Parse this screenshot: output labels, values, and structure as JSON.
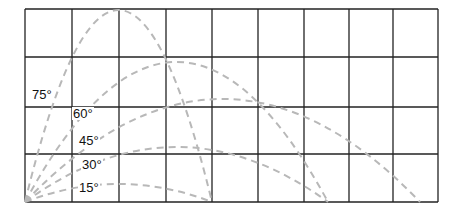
{
  "diagram": {
    "grid": {
      "left": 25,
      "top": 9,
      "right": 438,
      "bottom": 202,
      "columns_x": [
        25,
        72,
        119,
        166,
        212,
        258,
        304,
        349,
        393,
        438
      ],
      "rows_y": [
        9,
        57,
        107,
        154,
        202
      ],
      "line_color": "#222222"
    },
    "origin": {
      "x": 25,
      "y": 202
    },
    "curve_color": "#b8b8b8",
    "trajectories": [
      {
        "angle": "15°",
        "range_px": 187,
        "peak_px": 18,
        "label_x": 78,
        "label_y": 181
      },
      {
        "angle": "30°",
        "range_px": 303,
        "peak_px": 55,
        "label_x": 81,
        "label_y": 158
      },
      {
        "angle": "45°",
        "range_px": 395,
        "peak_px": 103,
        "label_x": 78,
        "label_y": 134
      },
      {
        "angle": "60°",
        "range_px": 303,
        "peak_px": 140,
        "label_x": 72,
        "label_y": 107
      },
      {
        "angle": "75°",
        "range_px": 187,
        "peak_px": 192,
        "label_x": 31,
        "label_y": 88
      }
    ]
  }
}
